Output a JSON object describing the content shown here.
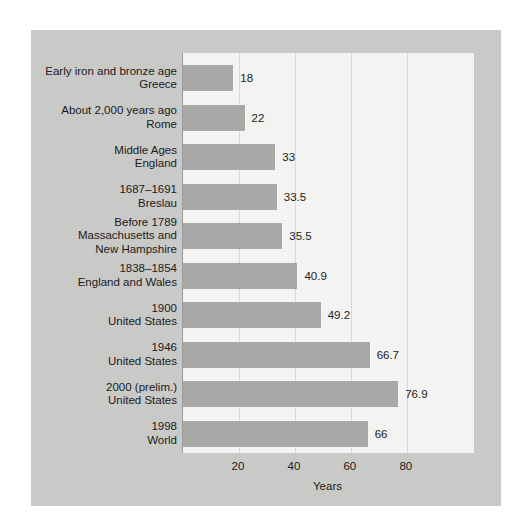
{
  "chart_data": {
    "type": "bar",
    "orientation": "horizontal",
    "title": "",
    "xlabel": "Years",
    "ylabel": "",
    "xlim": [
      0,
      104
    ],
    "xticks": [
      20,
      40,
      60,
      80
    ],
    "grid": true,
    "legend": "none",
    "categories": [
      "Early iron and bronze age\nGreece",
      "About 2,000 years ago\nRome",
      "Middle Ages\nEngland",
      "1687–1691\nBreslau",
      "Before 1789\nMassachusetts and\nNew Hampshire",
      "1838–1854\nEngland and Wales",
      "1900\nUnited States",
      "1946\nUnited States",
      "2000 (prelim.)\nUnited States",
      "1998\nWorld"
    ],
    "values": [
      18,
      22,
      33,
      33.5,
      35.5,
      40.9,
      49.2,
      66.7,
      76.9,
      66
    ],
    "value_labels": [
      "18",
      "22",
      "33",
      "33.5",
      "35.5",
      "40.9",
      "49.2",
      "66.7",
      "76.9",
      "66"
    ],
    "colors": {
      "bar": "#a8a8a6",
      "plot_background": "#f3f3f1",
      "panel_background": "#c9c9c7",
      "gridline": "#d8d8d4",
      "axis": "#9a9a98",
      "text": "#1b1b1b"
    }
  },
  "rows": [
    {
      "label_lines": [
        "Early iron and bronze age",
        "Greece"
      ],
      "value": 18,
      "value_label": "18"
    },
    {
      "label_lines": [
        "About 2,000 years ago",
        "Rome"
      ],
      "value": 22,
      "value_label": "22"
    },
    {
      "label_lines": [
        "Middle Ages",
        "England"
      ],
      "value": 33,
      "value_label": "33"
    },
    {
      "label_lines": [
        "1687–1691",
        "Breslau"
      ],
      "value": 33.5,
      "value_label": "33.5"
    },
    {
      "label_lines": [
        "Before 1789",
        "Massachusetts and",
        "New Hampshire"
      ],
      "value": 35.5,
      "value_label": "35.5"
    },
    {
      "label_lines": [
        "1838–1854",
        "England and Wales"
      ],
      "value": 40.9,
      "value_label": "40.9"
    },
    {
      "label_lines": [
        "1900",
        "United States"
      ],
      "value": 49.2,
      "value_label": "49.2"
    },
    {
      "label_lines": [
        "1946",
        "United States"
      ],
      "value": 66.7,
      "value_label": "66.7"
    },
    {
      "label_lines": [
        "2000 (prelim.)",
        "United States"
      ],
      "value": 76.9,
      "value_label": "76.9"
    },
    {
      "label_lines": [
        "1998",
        "World"
      ],
      "value": 66,
      "value_label": "66"
    }
  ],
  "axis": {
    "ticks": [
      "20",
      "40",
      "60",
      "80"
    ],
    "title": "Years"
  }
}
